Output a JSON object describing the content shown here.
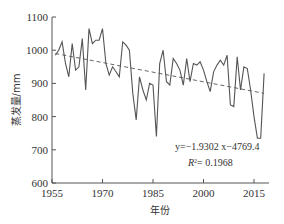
{
  "chart_data": {
    "type": "line",
    "title": "",
    "xlabel": "年份",
    "ylabel": "蒸发量/mm",
    "xlim": [
      1955,
      2019
    ],
    "ylim": [
      600,
      1100
    ],
    "xticks": [
      1955,
      1970,
      1985,
      2000,
      2015
    ],
    "yticks": [
      600,
      700,
      800,
      900,
      1000,
      1100
    ],
    "grid": false,
    "legend": null,
    "x": [
      1956,
      1957,
      1958,
      1959,
      1960,
      1961,
      1962,
      1963,
      1964,
      1965,
      1966,
      1967,
      1968,
      1969,
      1970,
      1971,
      1972,
      1973,
      1974,
      1975,
      1976,
      1977,
      1978,
      1979,
      1980,
      1981,
      1982,
      1983,
      1984,
      1985,
      1986,
      1987,
      1988,
      1989,
      1990,
      1991,
      1992,
      1993,
      1994,
      1995,
      1996,
      1997,
      1998,
      1999,
      2000,
      2001,
      2002,
      2003,
      2004,
      2005,
      2006,
      2007,
      2008,
      2009,
      2010,
      2011,
      2012,
      2013,
      2014,
      2015,
      2016,
      2017,
      2018
    ],
    "series": [
      {
        "name": "蒸发量",
        "style": "solid",
        "values": [
          985,
          1000,
          1025,
          960,
          920,
          1020,
          940,
          950,
          1035,
          880,
          1065,
          1020,
          1030,
          1030,
          1065,
          960,
          925,
          950,
          935,
          920,
          1025,
          1015,
          1000,
          870,
          790,
          920,
          880,
          850,
          900,
          895,
          740,
          960,
          1000,
          905,
          895,
          975,
          960,
          940,
          895,
          975,
          905,
          960,
          955,
          965,
          940,
          905,
          875,
          935,
          955,
          970,
          955,
          985,
          835,
          830,
          980,
          880,
          950,
          945,
          880,
          800,
          735,
          735,
          930
        ]
      },
      {
        "name": "趋势线",
        "style": "dashed",
        "equation": "y=-1.9302x-4769.4",
        "r2": 0.1968,
        "start": {
          "x": 1956,
          "y": 990
        },
        "end": {
          "x": 2018,
          "y": 870
        }
      }
    ],
    "annotations": [
      {
        "text": "y=-1.9302 x-4769.4"
      },
      {
        "text": "R²= 0.1968"
      }
    ]
  },
  "labels": {
    "xlabel": "年份",
    "ylabel": "蒸发量/mm",
    "equation": "y=−1.9302 x−4769.4",
    "r2_prefix": "R",
    "r2_sup": "2",
    "r2_value": "= 0.1968"
  }
}
